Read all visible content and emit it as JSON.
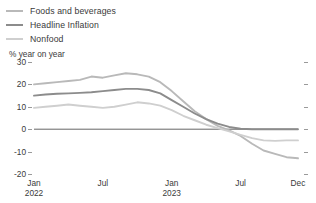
{
  "chart_data": {
    "type": "line",
    "title": "",
    "subtitle": "",
    "ylabel": "% year on year",
    "xlabel": "",
    "grid": false,
    "legend_position": "top-left",
    "ylim": [
      -20,
      30
    ],
    "yticks": [
      30,
      20,
      10,
      0,
      -10,
      -20
    ],
    "ytick_labels": [
      "30",
      "20",
      "10",
      "0",
      "-10",
      "-20"
    ],
    "xticks": [
      "Jan 2022",
      "Jul",
      "Jan 2023",
      "Jul",
      "Dec"
    ],
    "xtick_labels": [
      {
        "month": "Jan",
        "year": "2022"
      },
      {
        "month": "Jul",
        "year": ""
      },
      {
        "month": "Jan",
        "year": "2023"
      },
      {
        "month": "Jul",
        "year": ""
      },
      {
        "month": "Dec",
        "year": ""
      }
    ],
    "x": [
      "Jan 2022",
      "Feb 2022",
      "Mar 2022",
      "Apr 2022",
      "May 2022",
      "Jun 2022",
      "Jul 2022",
      "Aug 2022",
      "Sep 2022",
      "Oct 2022",
      "Nov 2022",
      "Dec 2022",
      "Jan 2023",
      "Feb 2023",
      "Mar 2023",
      "Apr 2023",
      "May 2023",
      "Jun 2023",
      "Jul 2023",
      "Aug 2023",
      "Sep 2023",
      "Oct 2023",
      "Nov 2023",
      "Dec 2023"
    ],
    "series": [
      {
        "name": "Foods and beverages",
        "color": "#b9b9b9",
        "values": [
          20.0,
          20.5,
          21.0,
          21.5,
          22.0,
          23.5,
          23.0,
          24.0,
          25.0,
          24.5,
          23.5,
          21.0,
          17.0,
          12.5,
          8.0,
          4.5,
          1.5,
          -0.5,
          -3.0,
          -6.5,
          -9.5,
          -11.0,
          -12.5,
          -13.0
        ]
      },
      {
        "name": "Headline Inflation",
        "color": "#8c8c8c",
        "values": [
          15.0,
          15.5,
          15.8,
          16.0,
          16.2,
          16.5,
          17.0,
          17.5,
          18.0,
          18.0,
          17.5,
          16.0,
          13.0,
          10.0,
          7.0,
          4.5,
          2.5,
          1.0,
          0.2,
          0.0,
          0.0,
          0.0,
          0.0,
          0.0
        ]
      },
      {
        "name": "Nonfood",
        "color": "#cfcfcf",
        "values": [
          9.5,
          10.0,
          10.5,
          11.0,
          10.5,
          10.0,
          9.5,
          10.0,
          11.0,
          12.0,
          11.5,
          10.5,
          8.5,
          6.0,
          4.0,
          2.0,
          0.5,
          -1.0,
          -2.5,
          -4.0,
          -5.0,
          -5.2,
          -5.0,
          -5.0
        ]
      }
    ]
  },
  "legend": {
    "items": [
      {
        "label": "Foods and beverages",
        "color": "#b9b9b9"
      },
      {
        "label": "Headline Inflation",
        "color": "#8c8c8c"
      },
      {
        "label": "Nonfood",
        "color": "#cfcfcf"
      }
    ]
  },
  "axis": {
    "y_title": "% year on year"
  }
}
